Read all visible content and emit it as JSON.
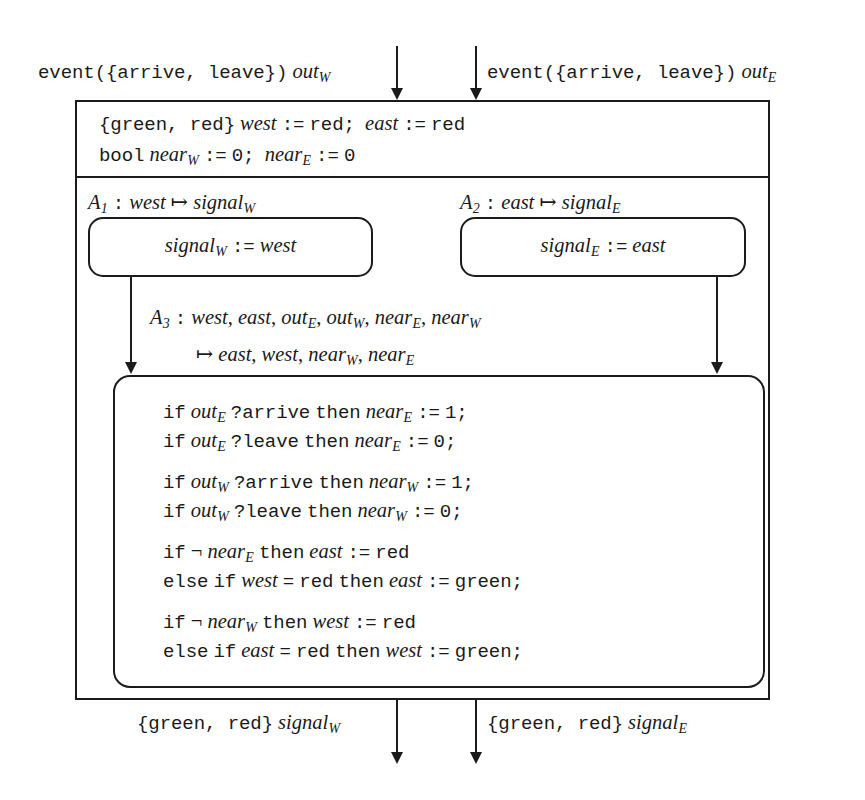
{
  "diagram": {
    "ink_color": "#1b1b1b",
    "background_color": "#ffffff"
  },
  "ports": {
    "inputs": [
      {
        "name": "out-w",
        "label": "event({arrive, leave}) outW"
      },
      {
        "name": "out-e",
        "label": "event({arrive, leave}) outE"
      }
    ],
    "outputs": [
      {
        "name": "signal-w",
        "label": "{green, red} signalW"
      },
      {
        "name": "signal-e",
        "label": "{green, red} signalE"
      }
    ]
  },
  "declarations": {
    "line1": "{green, red} west := red;  east := red",
    "line2": "bool nearW := 0;  nearE := 0"
  },
  "atoms": [
    {
      "id": "A1",
      "signature": "A1 : west ↦ signalW",
      "body": "signalW := west"
    },
    {
      "id": "A2",
      "signature": "A2 : east ↦ signalE",
      "body": "signalE := east"
    },
    {
      "id": "A3",
      "signature_line1": "A3 : west, east, outE, outW, nearE, nearW",
      "signature_line2": "↦ east, west, nearW, nearE",
      "statements": [
        "if outE ? arrive then nearE := 1;",
        "if outE ? leave then nearE := 0;",
        "if outW ? arrive then nearW := 1;",
        "if outW ? leave then nearW := 0;",
        "if ¬ nearE then east := red",
        "else if west = red then east := green;",
        "if ¬ nearW then west := red",
        "else if east = red then west := green;"
      ]
    }
  ]
}
